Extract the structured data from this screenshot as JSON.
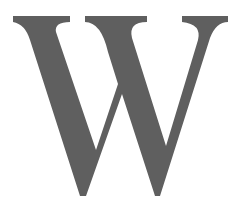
{
  "letter": {
    "char": "W",
    "color": "#5f5f5f",
    "background": "#ffffff"
  }
}
